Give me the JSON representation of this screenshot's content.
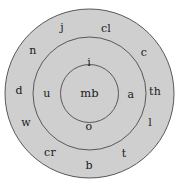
{
  "diagram": {
    "type": "concentric-circles",
    "background_color": "#ffffff",
    "fill_color": "#cfcfcf",
    "stroke_color": "#58585a",
    "text_color": "#1a1a1a",
    "center": {
      "cx": 89.5,
      "cy": 93.5
    },
    "circles": [
      {
        "name": "outer-circle",
        "r": 84.5,
        "filled": true
      },
      {
        "name": "middle-circle",
        "r": 56.5,
        "filled": true
      },
      {
        "name": "inner-circle",
        "r": 29.0,
        "filled": true
      }
    ],
    "center_node": {
      "label": "mb",
      "x": 89.5,
      "y": 93.5
    },
    "inner_ring_labels": [
      {
        "label": "i",
        "x": 89,
        "y": 63
      },
      {
        "label": "u",
        "x": 47,
        "y": 94
      },
      {
        "label": "a",
        "x": 131,
        "y": 95
      },
      {
        "label": "o",
        "x": 89,
        "y": 127
      }
    ],
    "outer_ring_labels": [
      {
        "label": "j",
        "x": 62,
        "y": 28
      },
      {
        "label": "cl",
        "x": 106,
        "y": 29
      },
      {
        "label": "n",
        "x": 33,
        "y": 51
      },
      {
        "label": "c",
        "x": 144,
        "y": 53
      },
      {
        "label": "d",
        "x": 19,
        "y": 91
      },
      {
        "label": "th",
        "x": 155,
        "y": 92
      },
      {
        "label": "w",
        "x": 26,
        "y": 123
      },
      {
        "label": "l",
        "x": 150,
        "y": 123
      },
      {
        "label": "cr",
        "x": 50,
        "y": 153
      },
      {
        "label": "t",
        "x": 124,
        "y": 154
      },
      {
        "label": "b",
        "x": 89,
        "y": 166
      }
    ]
  }
}
